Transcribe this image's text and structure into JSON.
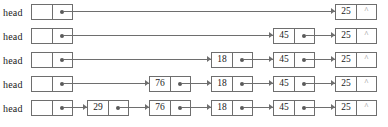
{
  "diagram": {
    "head_label": "head",
    "null_symbol": "^",
    "pointer_symbol": "•",
    "colors": {
      "border": "#6e6e6e",
      "text": "#1a1a1a",
      "dot": "#5a5a5a",
      "null": "#7a7a7a",
      "background": "#ffffff"
    },
    "layout": {
      "node_width": 42,
      "node_height": 18,
      "node_pitch": 62,
      "row_pitch": 24,
      "head_x": 31,
      "last_node_x": 335
    },
    "rows": [
      {
        "index": 0,
        "head_label": "head",
        "nodes": [
          {
            "value": "25",
            "next": "null"
          }
        ]
      },
      {
        "index": 1,
        "head_label": "head",
        "nodes": [
          {
            "value": "45",
            "next": "pointer"
          },
          {
            "value": "25",
            "next": "null"
          }
        ]
      },
      {
        "index": 2,
        "head_label": "head",
        "nodes": [
          {
            "value": "18",
            "next": "pointer"
          },
          {
            "value": "45",
            "next": "pointer"
          },
          {
            "value": "25",
            "next": "null"
          }
        ]
      },
      {
        "index": 3,
        "head_label": "head",
        "nodes": [
          {
            "value": "76",
            "next": "pointer"
          },
          {
            "value": "18",
            "next": "pointer"
          },
          {
            "value": "45",
            "next": "pointer"
          },
          {
            "value": "25",
            "next": "null"
          }
        ]
      },
      {
        "index": 4,
        "head_label": "head",
        "nodes": [
          {
            "value": "29",
            "next": "pointer"
          },
          {
            "value": "76",
            "next": "pointer"
          },
          {
            "value": "18",
            "next": "pointer"
          },
          {
            "value": "45",
            "next": "pointer"
          },
          {
            "value": "25",
            "next": "null"
          }
        ]
      }
    ]
  }
}
